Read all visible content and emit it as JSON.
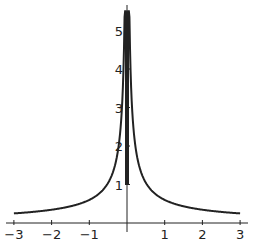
{
  "chart_data": {
    "type": "line",
    "title": "",
    "xlabel": "",
    "ylabel": "",
    "xlim": [
      -3,
      3
    ],
    "ylim": [
      0,
      5.5
    ],
    "grid": false,
    "legend": null,
    "x_ticks": [
      "-3",
      "-2",
      "-1",
      "1",
      "2",
      "3"
    ],
    "y_ticks": [
      "1",
      "2",
      "3",
      "4",
      "5"
    ],
    "series": [
      {
        "name": "f(x)",
        "x": [
          -3,
          -2.5,
          -2,
          -1.5,
          -1,
          -0.75,
          -0.5,
          -0.3,
          -0.2,
          -0.1,
          -0.05,
          -0.02,
          0.02,
          0.05,
          0.1,
          0.2,
          0.3,
          0.5,
          0.75,
          1,
          1.5,
          2,
          2.5,
          3
        ],
        "y": [
          0.25,
          0.29,
          0.34,
          0.43,
          0.6,
          0.75,
          1.0,
          1.4,
          1.8,
          2.6,
          3.4,
          5.5,
          5.5,
          3.4,
          2.6,
          1.8,
          1.4,
          1.0,
          0.75,
          0.6,
          0.43,
          0.34,
          0.29,
          0.25
        ]
      }
    ]
  },
  "axes": {
    "x_tick_labels": [
      "-3",
      "-2",
      "-1",
      "1",
      "2",
      "3"
    ],
    "y_tick_labels": [
      "1",
      "2",
      "3",
      "4",
      "5"
    ]
  }
}
